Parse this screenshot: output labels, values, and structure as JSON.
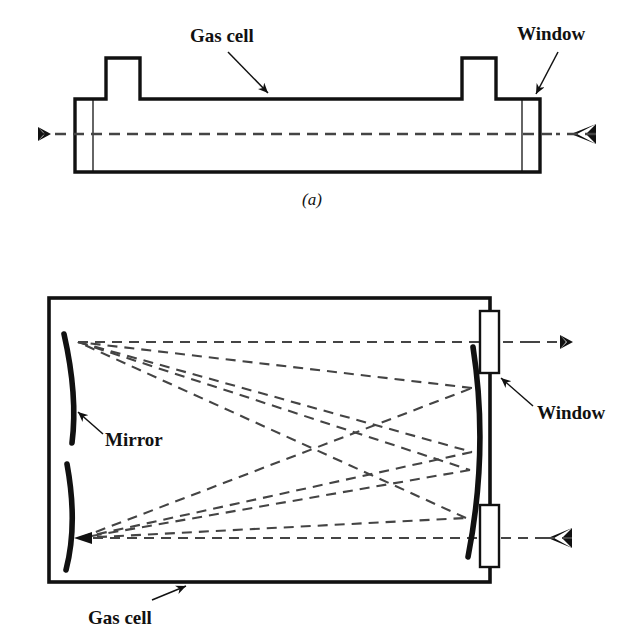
{
  "figure": {
    "type": "optical-diagram",
    "stroke_color": "#111111",
    "beam_color": "#444444",
    "background": "#ffffff"
  },
  "panel_a": {
    "caption": "(a)",
    "labels": {
      "gas_cell": "Gas cell",
      "window": "Window"
    },
    "beam": {
      "name": "optical-axis-beam",
      "style": "dashed",
      "left_arrow": "outgoing",
      "right_arrow": "incoming"
    },
    "parts": [
      "cell-body",
      "left-port-stub",
      "right-port-stub",
      "left-window",
      "right-window"
    ]
  },
  "panel_b": {
    "labels": {
      "gas_cell": "Gas cell",
      "window": "Window",
      "mirror": "Mirror"
    },
    "beam": {
      "name": "multipass-beam",
      "style": "dashed",
      "entrance": "bottom-right",
      "exit": "top-right",
      "passes": 8
    },
    "parts": [
      "cell-enclosure",
      "upper-left-mirror",
      "lower-left-mirror",
      "right-field-mirror",
      "top-window",
      "bottom-window"
    ]
  }
}
